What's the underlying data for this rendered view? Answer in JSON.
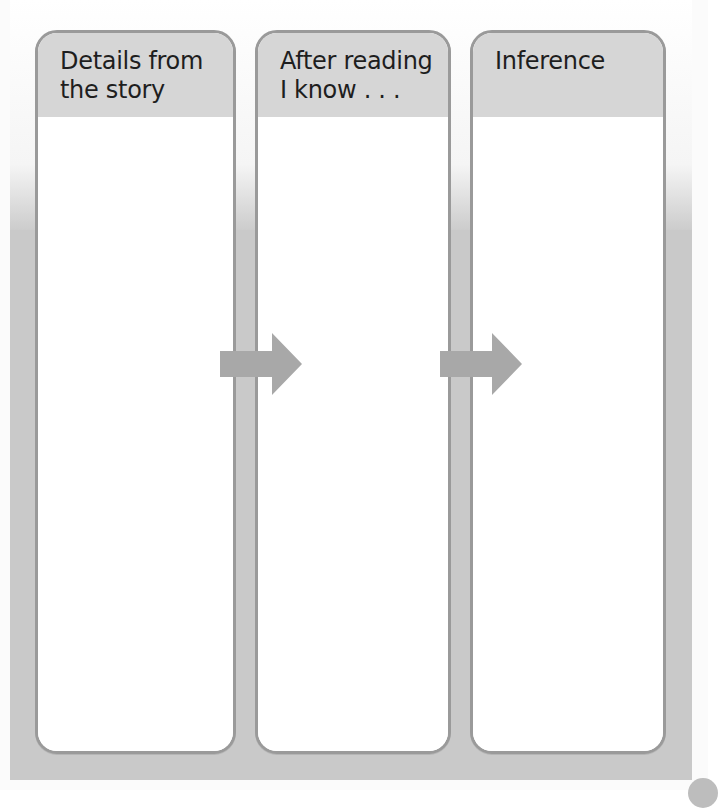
{
  "diagram": {
    "type": "three-column inference graphic organizer",
    "columns": [
      {
        "id": "details",
        "title": "Details from\nthe story",
        "body": ""
      },
      {
        "id": "know",
        "title": "After reading\nI know . . .",
        "body": ""
      },
      {
        "id": "inference",
        "title": "Inference",
        "body": ""
      }
    ],
    "connectors": [
      {
        "from": "details",
        "to": "know",
        "shape": "right-arrow"
      },
      {
        "from": "know",
        "to": "inference",
        "shape": "right-arrow"
      }
    ]
  },
  "colors": {
    "header_fill": "#d6d6d6",
    "panel_border": "#9a9a9a",
    "frame_fill": "#c9c9c9",
    "arrow_fill": "#a8a8a8",
    "title_text": "#1e1e1e"
  }
}
